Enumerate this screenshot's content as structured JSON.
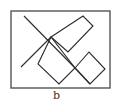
{
  "figure": {
    "caption": "b",
    "stroke_color": "#2a2a2a",
    "frame_color": "#555555",
    "frame": {
      "x": 11,
      "y": 11,
      "width": 99,
      "height": 77
    },
    "lines": [
      {
        "name": "long-diagonal",
        "points": "24,16 75,68 90,84"
      },
      {
        "name": "rising-line",
        "points": "21,67 51,37"
      }
    ],
    "shapes": [
      {
        "name": "narrow-rectangle",
        "points": "51,37 83,16 93,26 68,52"
      },
      {
        "name": "left-diamond",
        "points": "51,37 38,64 59,84 75,68"
      },
      {
        "name": "right-diamond",
        "points": "75,68 89,52 105,69 90,84"
      }
    ]
  }
}
